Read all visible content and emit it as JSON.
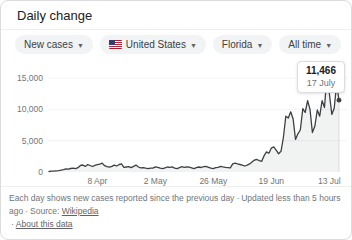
{
  "card": {
    "title": "Daily change"
  },
  "filters": [
    {
      "label": "New cases"
    },
    {
      "label": "United States"
    },
    {
      "label": "Florida"
    },
    {
      "label": "All time"
    }
  ],
  "tooltip": {
    "value": "11,466",
    "date": "17 July"
  },
  "footer": {
    "description": "Each day shows new cases reported since the previous day",
    "separator": "·",
    "updated": "Updated less than 5 hours ago",
    "source_label": "Source:",
    "source_link": "Wikipedia",
    "about_link": "About this data"
  },
  "chart_data": {
    "type": "area",
    "title": "Daily change",
    "series_name": "New cases",
    "region": "Florida, United States",
    "time_range": "All time",
    "start_date": "19 March",
    "end_date": "17 July",
    "x_tick_labels": [
      "8 Apr",
      "2 May",
      "26 May",
      "19 Jun",
      "13 Jul"
    ],
    "x_tick_indices": [
      20,
      44,
      68,
      92,
      116
    ],
    "y_ticks": [
      0,
      5000,
      10000,
      15000
    ],
    "y_tick_labels": [
      "0",
      "5,000",
      "10,000",
      "15,000"
    ],
    "ylim": [
      0,
      15000
    ],
    "grid": "horizontal-faint",
    "legend": "none",
    "line_color": "#3c4043",
    "area_color": "rgba(60,64,67,0.07)",
    "highlight": {
      "index": 120,
      "value": 11466,
      "date": "17 July"
    },
    "values": [
      80,
      134,
      151,
      192,
      216,
      290,
      390,
      503,
      450,
      560,
      630,
      524,
      680,
      1035,
      1120,
      900,
      1180,
      1040,
      880,
      1060,
      1180,
      1250,
      1413,
      1000,
      850,
      770,
      890,
      1100,
      950,
      1200,
      1300,
      750,
      790,
      850,
      700,
      900,
      1100,
      800,
      650,
      700,
      610,
      550,
      600,
      620,
      820,
      750,
      600,
      550,
      650,
      800,
      750,
      820,
      600,
      550,
      700,
      850,
      750,
      820,
      760,
      650,
      550,
      700,
      800,
      720,
      850,
      900,
      750,
      600,
      550,
      700,
      750,
      900,
      820,
      750,
      700,
      650,
      1300,
      1400,
      1300,
      1200,
      1100,
      950,
      1100,
      1300,
      1600,
      1900,
      2000,
      1800,
      1700,
      2600,
      3200,
      3000,
      3800,
      4000,
      3500,
      2900,
      3300,
      5500,
      8900,
      8600,
      9600,
      8500,
      5200,
      6100,
      6700,
      10100,
      9500,
      11400,
      10000,
      6300,
      7300,
      9900,
      8900,
      11400,
      10300,
      15300,
      12600,
      9194,
      10181,
      13965,
      11466
    ]
  }
}
